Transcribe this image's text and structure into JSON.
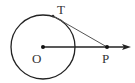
{
  "diagram": {
    "title": "",
    "circle": {
      "center_label": "O",
      "cx": 43,
      "cy": 47,
      "r": 32
    },
    "points": [
      {
        "label": "O",
        "x": 43,
        "y": 47
      },
      {
        "label": "T",
        "x": 53,
        "y": 16
      },
      {
        "label": "P",
        "x": 107,
        "y": 47
      }
    ],
    "labels": {
      "O": "O",
      "T": "T",
      "P": "P"
    },
    "segments": [
      {
        "from": "T",
        "to": "P",
        "desc": "tangent line"
      },
      {
        "from": "O",
        "to": "ray",
        "desc": "ray from O through P with arrow"
      }
    ],
    "colors": {
      "stroke": "#222222",
      "tangent": "#555555",
      "label": "#333333"
    }
  }
}
